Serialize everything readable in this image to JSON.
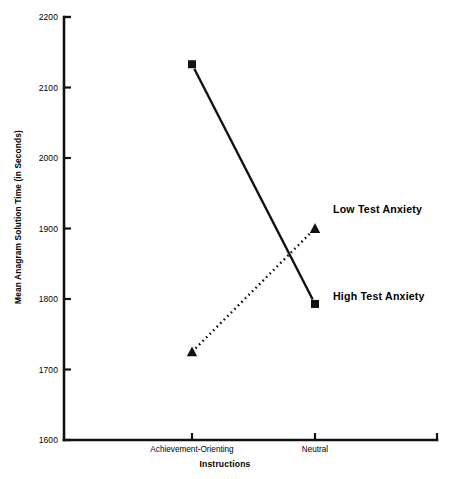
{
  "chart_data": {
    "type": "line",
    "title": "",
    "xlabel": "Instructions",
    "ylabel": "Mean Anagram Solution Time  (in Seconds)",
    "categories": [
      "Achievement-Orienting",
      "Neutral"
    ],
    "ylim": [
      1600,
      2200
    ],
    "yticks": [
      1600,
      1700,
      1800,
      1900,
      2000,
      2100,
      2200
    ],
    "ytick_labels": [
      "1600",
      "1700",
      "1800",
      "1900",
      "2000",
      "2100",
      "2200"
    ],
    "grid": false,
    "legend_position": "inline-right",
    "series": [
      {
        "name": "High Test Anxiety",
        "values": [
          2133,
          1793
        ],
        "marker": "square",
        "line_style": "solid",
        "color": "#111111"
      },
      {
        "name": "Low Test Anxiety",
        "values": [
          1725,
          1900
        ],
        "marker": "triangle",
        "line_style": "dotted",
        "color": "#111111"
      }
    ],
    "annotations": [
      {
        "text": "Low Test Anxiety",
        "series": "Low Test Anxiety"
      },
      {
        "text": "High Test Anxiety",
        "series": "High Test Anxiety"
      }
    ]
  }
}
